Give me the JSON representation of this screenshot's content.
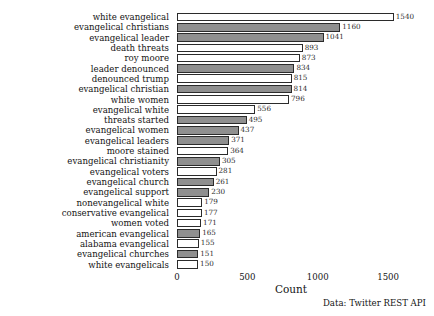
{
  "chart_data": {
    "type": "bar",
    "orientation": "horizontal",
    "title": "",
    "xlabel": "Count",
    "ylabel": "",
    "xlim": [
      0,
      1620
    ],
    "xticks": [
      "0",
      "500",
      "1000",
      "1500"
    ],
    "xtick_values": [
      0,
      500,
      1000,
      1500
    ],
    "grid": false,
    "legend": null,
    "categories": [
      "white evangelical",
      "evangelical christians",
      "evangelical leader",
      "death threats",
      "roy moore",
      "leader denounced",
      "denounced trump",
      "evangelical christian",
      "white women",
      "evangelical white",
      "threats started",
      "evangelical women",
      "evangelical leaders",
      "moore stained",
      "evangelical christianity",
      "evangelical voters",
      "evangelical church",
      "evangelical support",
      "nonevangelical white",
      "conservative evangelical",
      "women voted",
      "american evangelical",
      "alabama evangelical",
      "evangelical churches",
      "white evangelicals"
    ],
    "values": [
      1540,
      1160,
      1041,
      893,
      873,
      834,
      815,
      814,
      796,
      556,
      495,
      437,
      371,
      364,
      305,
      281,
      261,
      230,
      179,
      177,
      171,
      165,
      155,
      151,
      150
    ],
    "bar_fills": [
      "white",
      "gray",
      "gray",
      "white",
      "white",
      "gray",
      "white",
      "gray",
      "white",
      "white",
      "gray",
      "gray",
      "gray",
      "white",
      "gray",
      "white",
      "gray",
      "gray",
      "white",
      "white",
      "white",
      "gray",
      "white",
      "gray",
      "white"
    ],
    "colors": {
      "bar_white": "#ffffff",
      "bar_gray": "#8f8f8f",
      "bar_edge": "#2b2b2b",
      "text": "#141414",
      "background": "#ffffff"
    }
  },
  "caption": {
    "text": "Data: Twitter REST API"
  }
}
